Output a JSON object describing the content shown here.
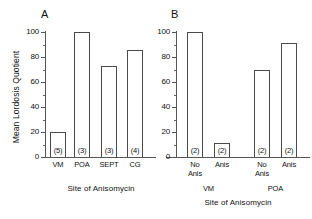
{
  "figure": {
    "yaxis_title": "Mean Lordosis Quotient",
    "ytick_labels": [
      "0",
      "20",
      "40",
      "60",
      "80",
      "100"
    ],
    "ytick_values": [
      0,
      20,
      40,
      60,
      80,
      100
    ],
    "xaxis_title": "Site of Anisomycin"
  },
  "panelA": {
    "letter": "A",
    "xaxis_title": "Site of Anisomycin"
  },
  "panelB": {
    "letter": "B",
    "xaxis_title": "Site of Anisomycin",
    "group_labels": [
      "VM",
      "POA"
    ]
  },
  "chart_data": [
    {
      "type": "bar",
      "panel": "A",
      "title": "A",
      "xlabel": "Site of Anisomycin",
      "ylabel": "Mean Lordosis Quotient",
      "ylim": [
        0,
        100
      ],
      "yticks": [
        0,
        20,
        40,
        60,
        80,
        100
      ],
      "minor_ticks": true,
      "grid": false,
      "legend": "none",
      "categories": [
        "VM",
        "POA",
        "SEPT",
        "CG"
      ],
      "values": [
        20,
        100,
        73,
        86
      ],
      "annotations": [
        "(5)",
        "(3)",
        "(3)",
        "(4)"
      ],
      "annotation_meaning": "sample size n, printed inside base of each bar"
    },
    {
      "type": "bar",
      "panel": "B",
      "title": "B",
      "xlabel": "Site of Anisomycin",
      "ylabel": "Mean Lordosis Quotient",
      "ylim": [
        0,
        100
      ],
      "yticks": [
        0,
        20,
        40,
        60,
        80,
        100
      ],
      "minor_ticks": true,
      "grid": false,
      "legend": "none",
      "categories": [
        "No Anis",
        "Anis",
        "No Anis",
        "Anis"
      ],
      "groups": [
        "VM",
        "VM",
        "POA",
        "POA"
      ],
      "values": [
        100,
        11,
        70,
        91
      ],
      "annotations": [
        "(2)",
        "(2)",
        "(2)",
        "(2)"
      ],
      "annotation_meaning": "sample size n, printed inside base of each bar"
    }
  ],
  "panelA_bars": [
    {
      "category": "VM",
      "value": 20,
      "n": "(5)"
    },
    {
      "category": "POA",
      "value": 100,
      "n": "(3)"
    },
    {
      "category": "SEPT",
      "value": 73,
      "n": "(3)"
    },
    {
      "category": "CG",
      "value": 86,
      "n": "(4)"
    }
  ],
  "panelB_bars": [
    {
      "line1": "No",
      "line2": "Anis",
      "value": 100,
      "n": "(2)",
      "group": "VM"
    },
    {
      "line1": "Anis",
      "line2": "",
      "value": 11,
      "n": "(2)",
      "group": "VM"
    },
    {
      "line1": "No",
      "line2": "Anis",
      "value": 70,
      "n": "(2)",
      "group": "POA"
    },
    {
      "line1": "Anis",
      "line2": "",
      "value": 91,
      "n": "(2)",
      "group": "POA"
    }
  ]
}
